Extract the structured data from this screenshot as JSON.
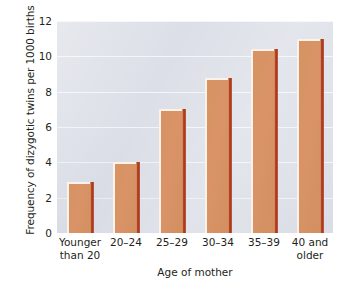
{
  "chart_data": {
    "type": "bar",
    "title": "",
    "subtitle": "",
    "xlabel": "Age of mother",
    "ylabel": "Frequency of dizygotic twins per 1000 births",
    "categories": [
      "Younger\nthan 20",
      "20–24",
      "25–29",
      "30–34",
      "35–39",
      "40 and\nolder"
    ],
    "category_lines": [
      [
        "Younger",
        "than 20"
      ],
      [
        "20–24",
        ""
      ],
      [
        "25–29",
        ""
      ],
      [
        "30–34",
        ""
      ],
      [
        "35–39",
        ""
      ],
      [
        "40 and",
        "older"
      ]
    ],
    "values": [
      2.9,
      4.0,
      7.0,
      8.8,
      10.4,
      11.0
    ],
    "ylim": [
      0,
      12
    ],
    "yticks": [
      0,
      2,
      4,
      6,
      8,
      10,
      12
    ],
    "ytick_labels": [
      "0",
      "2",
      "4",
      "6",
      "8",
      "10",
      "12"
    ],
    "grid": "horizontal",
    "legend": "none",
    "colors": {
      "bar_fill": "#d79363",
      "bar_highlight": "#fbf3e9",
      "bar_shadow": "#b03c20",
      "plot_background": "#dcdfe7",
      "gridline": "#f4f5f8",
      "text": "#231f20",
      "figure_background": "#ffffff"
    }
  }
}
